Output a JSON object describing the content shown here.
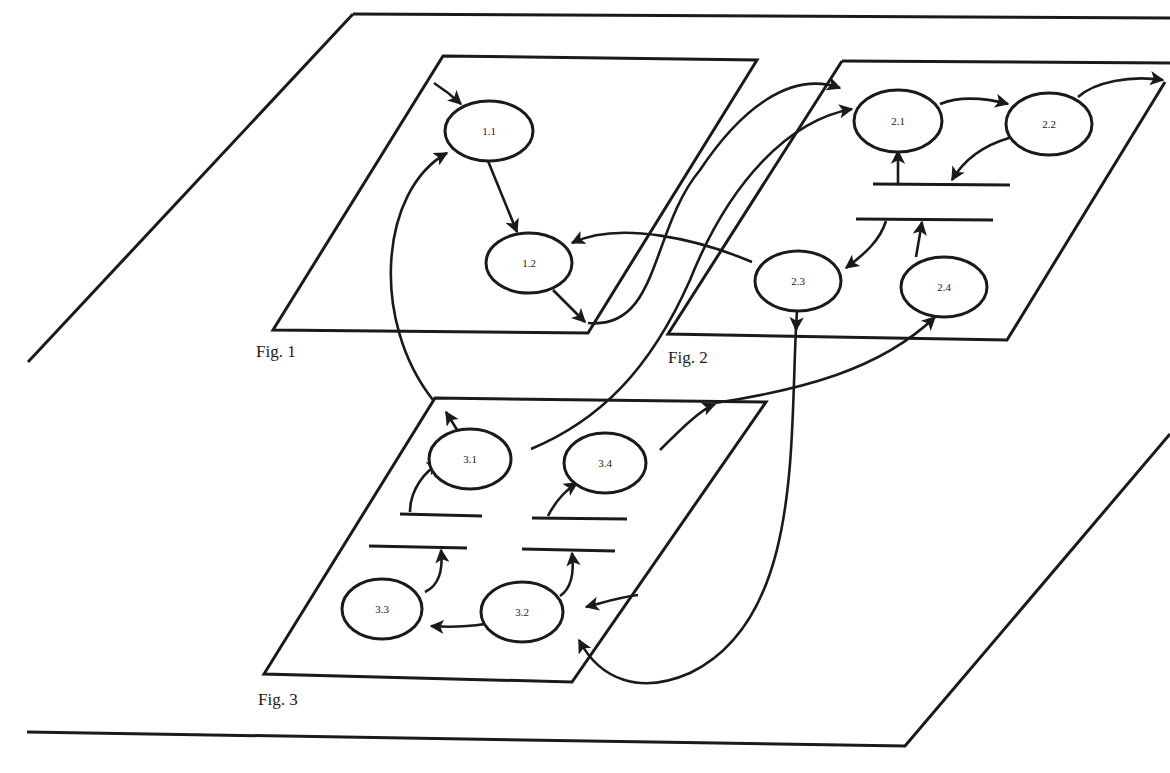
{
  "diagram": {
    "title": "",
    "colors": {
      "ink": "#1a1a1a",
      "paper": "#ffffff"
    },
    "figures": [
      {
        "id": "fig1",
        "label": "Fig. 1"
      },
      {
        "id": "fig2",
        "label": "Fig. 2"
      },
      {
        "id": "fig3",
        "label": "Fig. 3"
      }
    ],
    "nodes": [
      {
        "id": "n11",
        "label": "1.1",
        "figure": "Fig. 1"
      },
      {
        "id": "n12",
        "label": "1.2",
        "figure": "Fig. 1"
      },
      {
        "id": "n21",
        "label": "2.1",
        "figure": "Fig. 2"
      },
      {
        "id": "n22",
        "label": "2.2",
        "figure": "Fig. 2"
      },
      {
        "id": "n23",
        "label": "2.3",
        "figure": "Fig. 2"
      },
      {
        "id": "n24",
        "label": "2.4",
        "figure": "Fig. 2"
      },
      {
        "id": "n31",
        "label": "3.1",
        "figure": "Fig. 3"
      },
      {
        "id": "n32",
        "label": "3.2",
        "figure": "Fig. 3"
      },
      {
        "id": "n33",
        "label": "3.3",
        "figure": "Fig. 3"
      },
      {
        "id": "n34",
        "label": "3.4",
        "figure": "Fig. 3"
      }
    ],
    "data_stores": [
      {
        "id": "ds2",
        "figure": "Fig. 2",
        "description": "pair of parallel bars between 2.1/2.2 and 2.3/2.4"
      },
      {
        "id": "ds3a",
        "figure": "Fig. 3",
        "description": "pair of parallel bars between 3.1 and 3.3"
      },
      {
        "id": "ds3b",
        "figure": "Fig. 3",
        "description": "pair of parallel bars between 3.4 and 3.2"
      }
    ],
    "edges": [
      {
        "from": "external",
        "to": "1.1"
      },
      {
        "from": "1.1",
        "to": "1.2"
      },
      {
        "from": "1.2",
        "to": "2.1",
        "via": "boundary of Fig. 1"
      },
      {
        "from": "2.3",
        "to": "1.2"
      },
      {
        "from": "3.1",
        "to": "1.1",
        "via": "boundary of Fig. 3"
      },
      {
        "from": "3.1",
        "to": "2.1"
      },
      {
        "from": "2.1",
        "to": "2.2"
      },
      {
        "from": "2.2",
        "to": "external",
        "via": "boundary of Fig. 2"
      },
      {
        "from": "2.2",
        "to": "store ds2"
      },
      {
        "from": "store ds2",
        "to": "2.1"
      },
      {
        "from": "store ds2",
        "to": "2.3"
      },
      {
        "from": "2.4",
        "to": "store ds2"
      },
      {
        "from": "2.3",
        "to": "3.2"
      },
      {
        "from": "3.4",
        "to": "2.4"
      },
      {
        "from": "store ds3a",
        "to": "3.1"
      },
      {
        "from": "3.3",
        "to": "store ds3a"
      },
      {
        "from": "store ds3b",
        "to": "3.4"
      },
      {
        "from": "3.2",
        "to": "store ds3b"
      },
      {
        "from": "3.2",
        "to": "3.3"
      },
      {
        "from": "external",
        "to": "3.2"
      }
    ]
  }
}
